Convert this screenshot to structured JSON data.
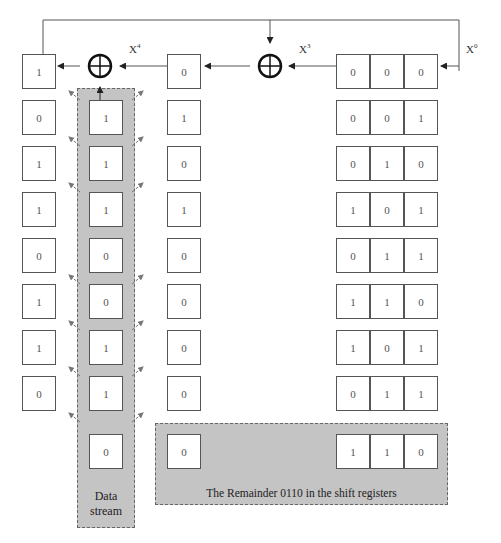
{
  "diagram": {
    "type": "CRC shift-register division",
    "labels": {
      "x4": "X",
      "x4_exp": "4",
      "x3": "X",
      "x3_exp": "3",
      "x0": "X",
      "x0_exp": "0"
    },
    "initial_state": {
      "left": "1",
      "middle": "0",
      "shift": [
        "0",
        "0",
        "0"
      ]
    },
    "rows": [
      {
        "left": "0",
        "data": "1",
        "middle": "1",
        "shift": [
          "0",
          "0",
          "1"
        ]
      },
      {
        "left": "1",
        "data": "1",
        "middle": "0",
        "shift": [
          "0",
          "1",
          "0"
        ]
      },
      {
        "left": "1",
        "data": "1",
        "middle": "1",
        "shift": [
          "1",
          "0",
          "1"
        ]
      },
      {
        "left": "0",
        "data": "0",
        "middle": "0",
        "shift": [
          "0",
          "1",
          "1"
        ]
      },
      {
        "left": "1",
        "data": "0",
        "middle": "0",
        "shift": [
          "1",
          "1",
          "0"
        ]
      },
      {
        "left": "1",
        "data": "1",
        "middle": "0",
        "shift": [
          "1",
          "0",
          "1"
        ]
      },
      {
        "left": "0",
        "data": "1",
        "middle": "0",
        "shift": [
          "0",
          "1",
          "1"
        ]
      }
    ],
    "final_row": {
      "data": "0",
      "middle": "0",
      "shift": [
        "1",
        "1",
        "0"
      ]
    },
    "data_stream_label_line1": "Data",
    "data_stream_label_line2": "stream",
    "remainder_caption": "The Remainder 0110 in the shift registers",
    "colors": {
      "band_fill": "#c4c4c4",
      "line": "#444444"
    }
  }
}
